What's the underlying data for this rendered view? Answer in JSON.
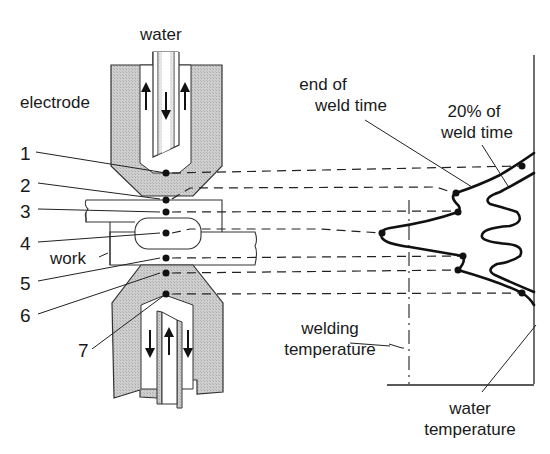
{
  "diagram": {
    "title_labels": {
      "water_top": "water",
      "electrode": "electrode",
      "work": "work",
      "end_of_weld_time_line1": "end of",
      "end_of_weld_time_line2": "weld time",
      "pct_weld_time_line1": "20% of",
      "pct_weld_time_line2": "weld time",
      "welding_temperature_line1": "welding",
      "welding_temperature_line2": "temperature",
      "water_temperature_line1": "water",
      "water_temperature_line2": "temperature"
    },
    "points": [
      {
        "label": "1",
        "y": 173
      },
      {
        "label": "2",
        "y": 200
      },
      {
        "label": "3",
        "y": 212
      },
      {
        "label": "4",
        "y": 233
      },
      {
        "label": "5",
        "y": 258
      },
      {
        "label": "6",
        "y": 273
      },
      {
        "label": "7",
        "y": 294
      }
    ],
    "colors": {
      "electrode_fill": "#c8c8c8",
      "line": "#111111",
      "background": "#ffffff"
    }
  }
}
